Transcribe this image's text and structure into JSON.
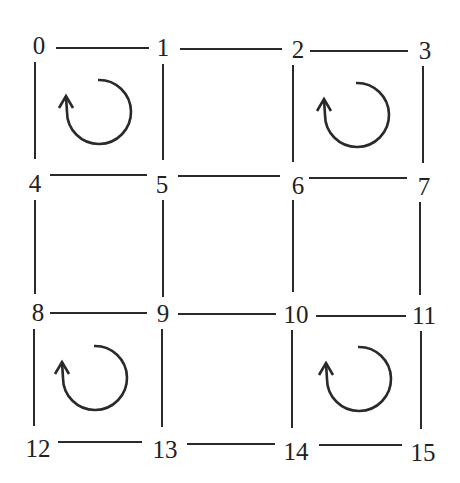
{
  "diagram": {
    "type": "4x4 grid graph with circulation arrows",
    "nodes": [
      {
        "id": "0",
        "x": 39,
        "y": 45
      },
      {
        "id": "1",
        "x": 163,
        "y": 47
      },
      {
        "id": "2",
        "x": 298,
        "y": 49
      },
      {
        "id": "3",
        "x": 425,
        "y": 50
      },
      {
        "id": "4",
        "x": 35,
        "y": 183
      },
      {
        "id": "5",
        "x": 162,
        "y": 184
      },
      {
        "id": "6",
        "x": 298,
        "y": 185
      },
      {
        "id": "7",
        "x": 424,
        "y": 186
      },
      {
        "id": "8",
        "x": 38,
        "y": 312
      },
      {
        "id": "9",
        "x": 163,
        "y": 313
      },
      {
        "id": "10",
        "x": 292,
        "y": 314
      },
      {
        "id": "11",
        "x": 422,
        "y": 315
      },
      {
        "id": "12",
        "x": 39,
        "y": 448
      },
      {
        "id": "13",
        "x": 167,
        "y": 449
      },
      {
        "id": "14",
        "x": 292,
        "y": 451
      },
      {
        "id": "15",
        "x": 420,
        "y": 452
      }
    ],
    "edges": [
      [
        "0",
        "1"
      ],
      [
        "1",
        "2"
      ],
      [
        "2",
        "3"
      ],
      [
        "4",
        "5"
      ],
      [
        "5",
        "6"
      ],
      [
        "6",
        "7"
      ],
      [
        "8",
        "9"
      ],
      [
        "9",
        "10"
      ],
      [
        "10",
        "11"
      ],
      [
        "12",
        "13"
      ],
      [
        "13",
        "14"
      ],
      [
        "14",
        "15"
      ],
      [
        "0",
        "4"
      ],
      [
        "4",
        "8"
      ],
      [
        "8",
        "12"
      ],
      [
        "1",
        "5"
      ],
      [
        "5",
        "9"
      ],
      [
        "9",
        "13"
      ],
      [
        "2",
        "6"
      ],
      [
        "6",
        "10"
      ],
      [
        "10",
        "14"
      ],
      [
        "3",
        "7"
      ],
      [
        "7",
        "11"
      ],
      [
        "11",
        "15"
      ]
    ],
    "circulations": [
      {
        "cell": "0-1-5-4",
        "direction": "counterclockwise",
        "cx": 98,
        "cy": 111
      },
      {
        "cell": "2-3-7-6",
        "direction": "counterclockwise",
        "cx": 357,
        "cy": 114
      },
      {
        "cell": "8-9-13-12",
        "direction": "counterclockwise",
        "cx": 95,
        "cy": 375
      },
      {
        "cell": "10-11-15-14",
        "direction": "counterclockwise",
        "cx": 358,
        "cy": 377
      }
    ],
    "colors": {
      "stroke": "#2a2a2a",
      "label": "#222222",
      "background": "#ffffff"
    }
  }
}
